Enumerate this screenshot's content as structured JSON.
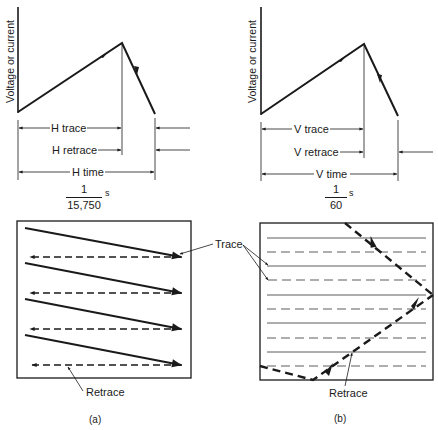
{
  "diagram": {
    "panel_a": {
      "caption": "(a)",
      "waveform": {
        "ylabel": "Voltage or current",
        "intervals": {
          "trace": "H trace",
          "retrace": "H retrace",
          "time": "H time"
        },
        "period": {
          "numerator": "1",
          "denominator": "15,750",
          "unit": "s"
        }
      },
      "raster": {
        "retrace_label": "Retrace",
        "line_pairs": 4
      }
    },
    "panel_b": {
      "caption": "(b)",
      "waveform": {
        "ylabel": "Voltage or current",
        "intervals": {
          "trace": "V trace",
          "retrace": "V retrace",
          "time": "V time"
        },
        "period": {
          "numerator": "1",
          "denominator": "60",
          "unit": "s"
        }
      },
      "raster": {
        "retrace_label": "Retrace",
        "line_pairs": 5
      }
    },
    "shared": {
      "trace_label": "Trace"
    }
  }
}
